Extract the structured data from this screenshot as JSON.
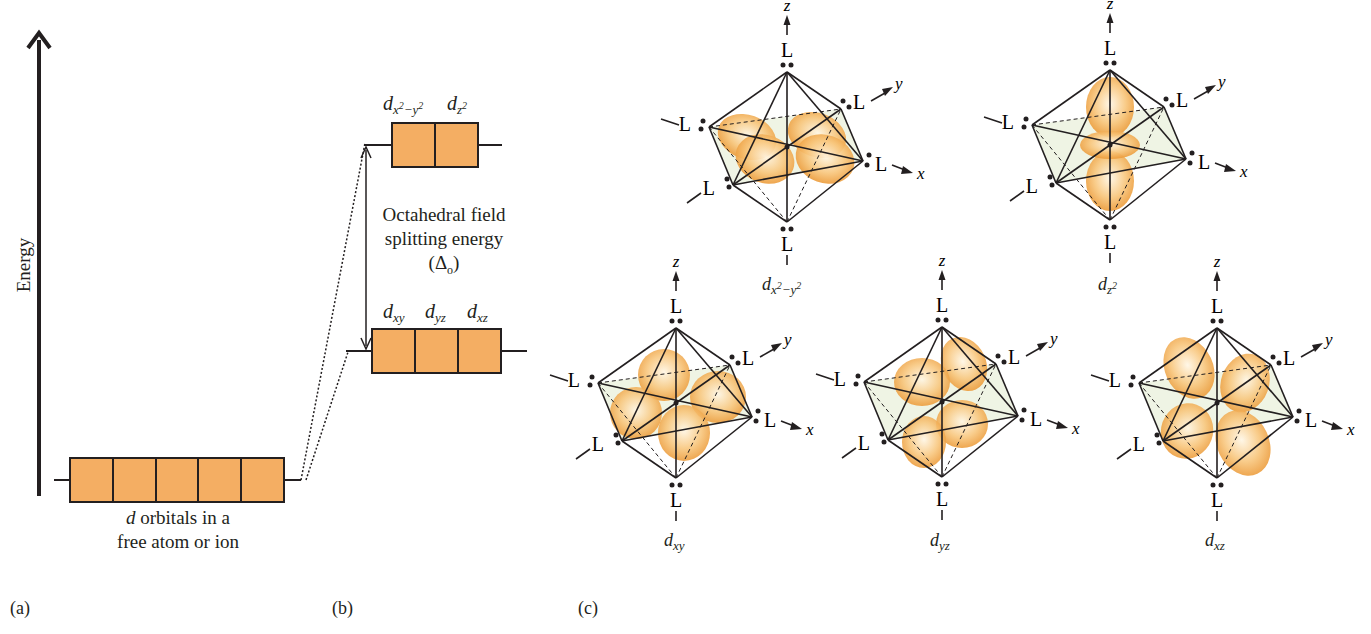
{
  "colors": {
    "orbital_fill": "#F4AE63",
    "line": "#231F20",
    "lobe": "#F5A840",
    "plane": "#E8EFD8"
  },
  "panel_a": {
    "label": "(a)",
    "axis_label": "Energy",
    "caption_line1_italic": "d",
    "caption_line1_rest": " orbitals in a",
    "caption_line2": "free atom or ion",
    "box_count": 5
  },
  "panel_b": {
    "label": "(b)",
    "upper_set": [
      {
        "base": "d",
        "sub": "x2−y2",
        "sub_html": "x",
        "sup1": "2",
        "mid": "−y",
        "sup2": "2"
      },
      {
        "base": "d",
        "sub": "z2"
      }
    ],
    "lower_set": [
      {
        "base": "d",
        "sub": "xy"
      },
      {
        "base": "d",
        "sub": "yz"
      },
      {
        "base": "d",
        "sub": "xz"
      }
    ],
    "splitting_label_line1": "Octahedral field",
    "splitting_label_line2": "splitting energy",
    "splitting_symbol": "(Δo)"
  },
  "panel_c": {
    "label": "(c)",
    "ligand_label": "L",
    "axis_labels": {
      "x": "x",
      "y": "y",
      "z": "z"
    },
    "diagrams": [
      {
        "orbital": "dx2−y2",
        "base": "d",
        "sub": "x2−y2"
      },
      {
        "orbital": "dz2",
        "base": "d",
        "sub": "z2"
      },
      {
        "orbital": "dxy",
        "base": "d",
        "sub": "xy"
      },
      {
        "orbital": "dyz",
        "base": "d",
        "sub": "yz"
      },
      {
        "orbital": "dxz",
        "base": "d",
        "sub": "xz"
      }
    ]
  }
}
